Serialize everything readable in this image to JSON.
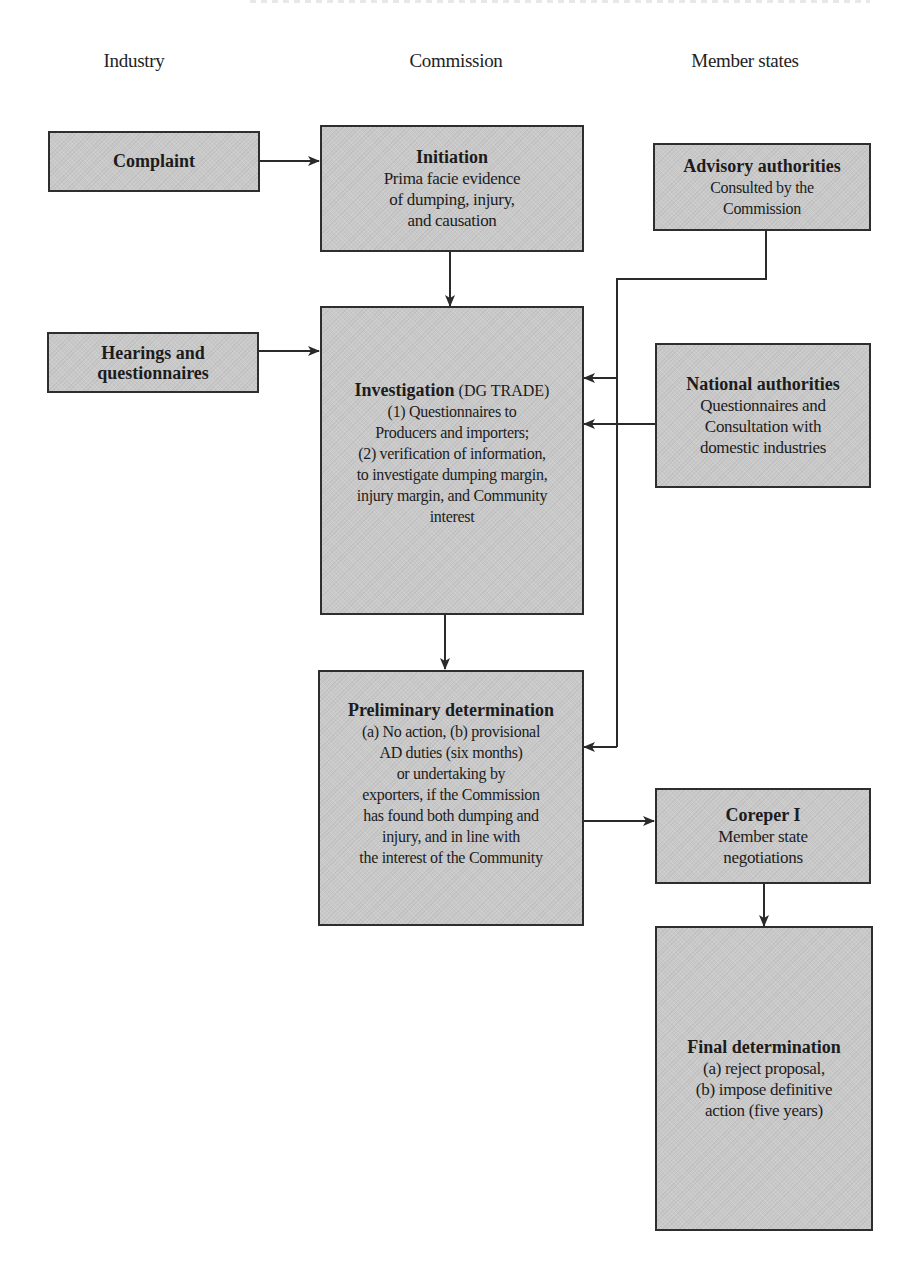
{
  "columns": [
    {
      "label": "Industry",
      "x": 134
    },
    {
      "label": "Commission",
      "x": 456
    },
    {
      "label": "Member states",
      "x": 745
    }
  ],
  "boxes": {
    "complaint": {
      "title": "Complaint",
      "lines": []
    },
    "initiation": {
      "title": "Initiation",
      "lines": [
        "Prima facie evidence",
        "of dumping, injury,",
        "and causation"
      ]
    },
    "advisory": {
      "title": "Advisory authorities",
      "lines": [
        "Consulted by the",
        "Commission"
      ]
    },
    "hearings": {
      "title_lines": [
        "Hearings and",
        "questionnaires"
      ]
    },
    "investigation": {
      "title": "Investigation",
      "title_suffix": " (DG TRADE)",
      "lines": [
        "(1) Questionnaires to",
        "Producers and importers;",
        "(2) verification of information,",
        "to investigate dumping margin,",
        "injury margin, and Community",
        "interest"
      ]
    },
    "national": {
      "title": "National authorities",
      "lines": [
        "Questionnaires and",
        "Consultation with",
        "domestic industries"
      ]
    },
    "preliminary": {
      "title": "Preliminary determination",
      "lines": [
        "(a) No action, (b) provisional",
        "AD duties (six months)",
        "or undertaking by",
        "exporters, if the Commission",
        "has found both dumping and",
        "injury, and in line with",
        "the interest of the Community"
      ]
    },
    "coreper": {
      "title": "Coreper I",
      "lines": [
        "Member state",
        "negotiations"
      ]
    },
    "final": {
      "title": "Final determination",
      "lines": [
        "(a) reject proposal,",
        "(b) impose definitive",
        "action (five years)"
      ]
    }
  },
  "edges": [
    {
      "from": "complaint",
      "to": "initiation"
    },
    {
      "from": "initiation",
      "to": "investigation"
    },
    {
      "from": "hearings",
      "to": "investigation"
    },
    {
      "from": "advisory",
      "to": "investigation"
    },
    {
      "from": "advisory",
      "to": "preliminary"
    },
    {
      "from": "national",
      "to": "investigation"
    },
    {
      "from": "investigation",
      "to": "preliminary"
    },
    {
      "from": "preliminary",
      "to": "coreper"
    },
    {
      "from": "coreper",
      "to": "final"
    }
  ],
  "colors": {
    "box_fill": "#c9c9c9",
    "box_border": "#2e2e2e",
    "line": "#2a2a2a"
  }
}
